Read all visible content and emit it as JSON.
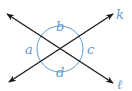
{
  "diagram": {
    "title": "",
    "lines": [
      {
        "name": "k",
        "label": "k",
        "from": [
          9,
          82
        ],
        "to": [
          113,
          14
        ]
      },
      {
        "name": "l",
        "label": "ℓ",
        "from": [
          7,
          14
        ],
        "to": [
          113,
          83
        ]
      }
    ],
    "intersection": [
      60,
      49
    ],
    "angle_circle_radius": 23,
    "angles": [
      {
        "label": "a",
        "position": "left"
      },
      {
        "label": "b",
        "position": "top"
      },
      {
        "label": "c",
        "position": "right"
      },
      {
        "label": "d",
        "position": "bottom"
      }
    ],
    "colors": {
      "line": "#1a1a1a",
      "accent": "#5a9bd0"
    }
  }
}
